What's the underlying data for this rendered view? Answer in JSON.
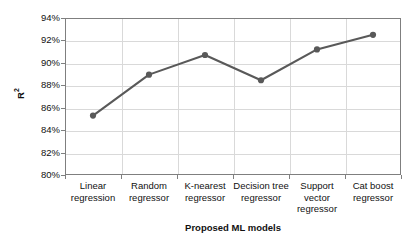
{
  "chart_data": {
    "type": "line",
    "title": "",
    "xlabel": "Proposed ML models",
    "ylabel": "R²",
    "ylabel_base": "R",
    "ylabel_sup": "2",
    "categories": [
      "Linear\nregression",
      "Random\nregressor",
      "K-nearest\nregressor",
      "Decision tree\nregressor",
      "Support\nvector\nregressor",
      "Cat boost\nregressor"
    ],
    "categories_flat": [
      "Linear regression",
      "Random regressor",
      "K-nearest regressor",
      "Decision tree regressor",
      "Support vector regressor",
      "Cat boost regressor"
    ],
    "values": [
      85.3,
      88.95,
      90.7,
      88.45,
      91.2,
      92.5
    ],
    "value_labels": [
      "85.3%",
      "88.95%",
      "90.7%",
      "88.45%",
      "91.2%",
      "92.5%"
    ],
    "ylim": [
      80,
      94
    ],
    "yticks": [
      80,
      82,
      84,
      86,
      88,
      90,
      92,
      94
    ],
    "ytick_labels": [
      "80%",
      "82%",
      "84%",
      "86%",
      "88%",
      "90%",
      "92%",
      "94%"
    ],
    "grid": "horizontal-and-vertical",
    "legend": "none",
    "series_name": "R²",
    "series_color": "#595959",
    "marker": "circle",
    "marker_color": "#595959",
    "grid_color": "#d9d9d9",
    "frame_color": "#7f7f7f",
    "background": "#ffffff"
  }
}
